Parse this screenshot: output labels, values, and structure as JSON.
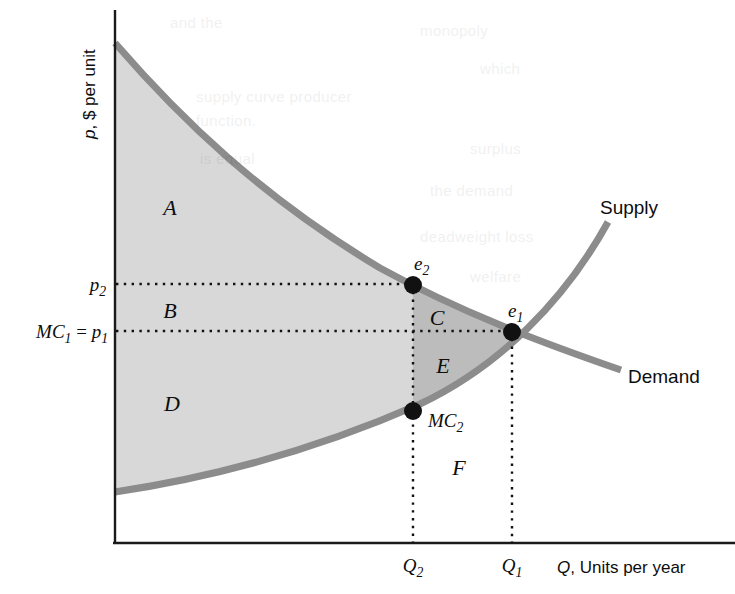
{
  "figure": {
    "type": "economics-supply-demand-diagram",
    "background_color": "#ffffff",
    "curve_color": "#8c8c8c",
    "shade_light": "#d8d8d8",
    "shade_dark": "#bcbcbc",
    "axis_color": "#1a1a1a"
  },
  "axes": {
    "y_label": "p, $ per unit",
    "y_label_italic_part": "p",
    "x_label": "Q, Units per year",
    "x_label_italic_part": "Q"
  },
  "curve_labels": {
    "supply": "Supply",
    "demand": "Demand"
  },
  "price_ticks": [
    {
      "id": "p2",
      "base": "p",
      "sub": "2",
      "text": "p2",
      "y_px": 284
    },
    {
      "id": "mc1p1",
      "base": "MC",
      "sub": "1",
      "text": "MC1 = p1",
      "y_px": 331
    }
  ],
  "quantity_ticks": [
    {
      "id": "q2",
      "base": "Q",
      "sub": "2",
      "text": "Q2",
      "x_px": 413
    },
    {
      "id": "q1",
      "base": "Q",
      "sub": "1",
      "text": "Q1",
      "x_px": 512
    }
  ],
  "points": [
    {
      "id": "e2",
      "base": "e",
      "sub": "2",
      "text": "e2",
      "x_px": 413,
      "y_px": 285
    },
    {
      "id": "e1",
      "base": "e",
      "sub": "1",
      "text": "e1",
      "x_px": 512,
      "y_px": 332
    },
    {
      "id": "mc2",
      "base": "MC",
      "sub": "2",
      "text": "MC2",
      "x_px": 413,
      "y_px": 411
    }
  ],
  "regions": [
    {
      "id": "A",
      "label": "A",
      "x_px": 170,
      "y_px": 208,
      "shade": "light"
    },
    {
      "id": "B",
      "label": "B",
      "x_px": 170,
      "y_px": 311,
      "shade": "light"
    },
    {
      "id": "C",
      "label": "C",
      "x_px": 437,
      "y_px": 318,
      "shade": "dark"
    },
    {
      "id": "D",
      "label": "D",
      "x_px": 172,
      "y_px": 404,
      "shade": "light"
    },
    {
      "id": "E",
      "label": "E",
      "x_px": 443,
      "y_px": 366,
      "shade": "dark"
    },
    {
      "id": "F",
      "label": "F",
      "x_px": 459,
      "y_px": 468,
      "shade": "none"
    }
  ],
  "chart_data": {
    "type": "line",
    "title": "",
    "xlabel": "Q, Units per year",
    "ylabel": "p, $ per unit",
    "grid": false,
    "legend": "inline-curve-labels",
    "series": [
      {
        "name": "Demand",
        "note": "downward sloping convex curve from upper-left to lower-right",
        "points_px": [
          [
            115,
            43
          ],
          [
            200,
            140
          ],
          [
            290,
            218
          ],
          [
            380,
            268
          ],
          [
            460,
            306
          ],
          [
            540,
            340
          ],
          [
            621,
            370
          ]
        ]
      },
      {
        "name": "Supply",
        "note": "upward sloping convex curve from lower-left to upper-right",
        "points_px": [
          [
            115,
            492
          ],
          [
            210,
            478
          ],
          [
            300,
            456
          ],
          [
            380,
            424
          ],
          [
            450,
            386
          ],
          [
            530,
            320
          ],
          [
            608,
            222
          ]
        ]
      }
    ],
    "equilibria": [
      {
        "name": "e1",
        "x_label": "Q1",
        "y_label": "MC1 = p1",
        "x_px": 512,
        "y_px": 332
      },
      {
        "name": "e2",
        "x_label": "Q2",
        "y_label": "p2",
        "x_px": 413,
        "y_px": 285
      },
      {
        "name": "MC2",
        "x_label": "Q2",
        "y_label": "MC2",
        "x_px": 413,
        "y_px": 411
      }
    ],
    "welfare_regions": [
      "A",
      "B",
      "C",
      "D",
      "E",
      "F"
    ],
    "axis_origin_px": [
      115,
      543
    ],
    "axis_x_end_px": 735,
    "axis_y_top_px": 10
  },
  "bleed_through_text": [
    {
      "text": "and the",
      "x": 170,
      "y": 14
    },
    {
      "text": "monopoly",
      "x": 420,
      "y": 22
    },
    {
      "text": "supply curve producer",
      "x": 196,
      "y": 88
    },
    {
      "text": "function.",
      "x": 196,
      "y": 112
    },
    {
      "text": "which",
      "x": 480,
      "y": 60
    },
    {
      "text": "is equal",
      "x": 200,
      "y": 150
    },
    {
      "text": "surplus",
      "x": 470,
      "y": 140
    },
    {
      "text": "the demand",
      "x": 430,
      "y": 182
    },
    {
      "text": "deadweight loss",
      "x": 420,
      "y": 228
    },
    {
      "text": "welfare",
      "x": 470,
      "y": 268
    }
  ]
}
